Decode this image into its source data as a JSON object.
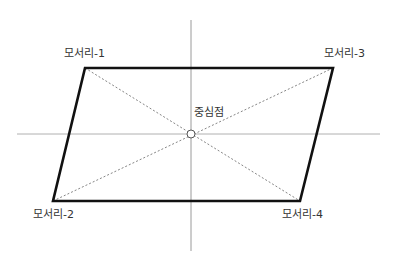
{
  "diagram": {
    "title": "",
    "labels": {
      "corner1": "모서리-1",
      "corner2": "모서리-2",
      "corner3": "모서리-3",
      "corner4": "모서리-4",
      "center": "중심점"
    },
    "points": {
      "corner1": [
        85,
        68
      ],
      "corner3": [
        333,
        68
      ],
      "corner2": [
        53,
        201
      ],
      "corner4": [
        300,
        201
      ],
      "center": [
        191,
        134
      ]
    },
    "axes": {
      "vertical": {
        "x": 191,
        "y1": 20,
        "y2": 251
      },
      "horizontal": {
        "y": 134,
        "x1": 17,
        "x2": 380
      }
    },
    "colors": {
      "outline": "#111111",
      "axis": "#9a9a9a",
      "diagonal": "#666666",
      "text": "#333333"
    }
  }
}
